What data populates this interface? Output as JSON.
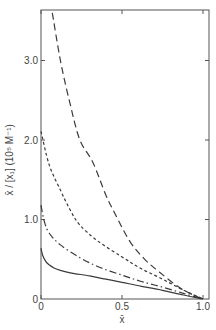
{
  "chart_data": {
    "type": "line",
    "title": "",
    "xlabel": "x̄",
    "ylabel": "x̄ / [x₁]  (10⁵ M⁻¹)",
    "xlim": [
      0,
      1.0
    ],
    "ylim": [
      0,
      3.6
    ],
    "grid": false,
    "legend": null,
    "x_ticks": [
      {
        "value": 0,
        "label": "0"
      },
      {
        "value": 0.5,
        "label": "0.5"
      },
      {
        "value": 1.0,
        "label": "1.0"
      }
    ],
    "y_ticks": [
      {
        "value": 0,
        "label": "0"
      },
      {
        "value": 1.0,
        "label": "1.0"
      },
      {
        "value": 2.0,
        "label": "2.0"
      },
      {
        "value": 3.0,
        "label": "3.0"
      }
    ],
    "series": [
      {
        "name": "long-dash curve",
        "style": "long-dash",
        "points": [
          [
            0.07,
            3.6
          ],
          [
            0.12,
            3.0
          ],
          [
            0.18,
            2.45
          ],
          [
            0.24,
            2.0
          ],
          [
            0.32,
            1.72
          ],
          [
            0.4,
            1.31
          ],
          [
            0.46,
            1.06
          ],
          [
            0.55,
            0.72
          ],
          [
            0.64,
            0.5
          ],
          [
            0.73,
            0.34
          ],
          [
            0.85,
            0.15
          ],
          [
            0.93,
            0.06
          ],
          [
            1.0,
            0.0
          ]
        ]
      },
      {
        "name": "short-dash curve",
        "style": "short-dash",
        "points": [
          [
            0.0,
            2.11
          ],
          [
            0.05,
            1.69
          ],
          [
            0.12,
            1.37
          ],
          [
            0.18,
            1.12
          ],
          [
            0.24,
            0.93
          ],
          [
            0.35,
            0.73
          ],
          [
            0.5,
            0.53
          ],
          [
            0.62,
            0.38
          ],
          [
            0.75,
            0.25
          ],
          [
            0.88,
            0.11
          ],
          [
            1.0,
            0.0
          ]
        ]
      },
      {
        "name": "dash-dot curve",
        "style": "dash-dot",
        "points": [
          [
            0.0,
            1.18
          ],
          [
            0.02,
            0.98
          ],
          [
            0.05,
            0.83
          ],
          [
            0.12,
            0.68
          ],
          [
            0.24,
            0.52
          ],
          [
            0.36,
            0.4
          ],
          [
            0.5,
            0.3
          ],
          [
            0.62,
            0.22
          ],
          [
            0.75,
            0.15
          ],
          [
            0.88,
            0.07
          ],
          [
            1.0,
            0.0
          ]
        ]
      },
      {
        "name": "solid curve",
        "style": "solid",
        "points": [
          [
            0.0,
            0.64
          ],
          [
            0.01,
            0.55
          ],
          [
            0.03,
            0.47
          ],
          [
            0.05,
            0.43
          ],
          [
            0.08,
            0.39
          ],
          [
            0.12,
            0.36
          ],
          [
            0.18,
            0.33
          ],
          [
            0.3,
            0.29
          ],
          [
            0.4,
            0.25
          ],
          [
            0.5,
            0.21
          ],
          [
            0.62,
            0.16
          ],
          [
            0.75,
            0.11
          ],
          [
            0.88,
            0.05
          ],
          [
            1.0,
            0.0
          ]
        ]
      }
    ]
  },
  "layout": {
    "plot_left": 41,
    "plot_right": 209,
    "plot_top": 10,
    "plot_bottom": 299,
    "x0_px": 41,
    "x_scale": 162,
    "y0_px": 299,
    "y_scale": 79.5,
    "line_color": "#3a3a3a",
    "axis_color": "#555555"
  }
}
